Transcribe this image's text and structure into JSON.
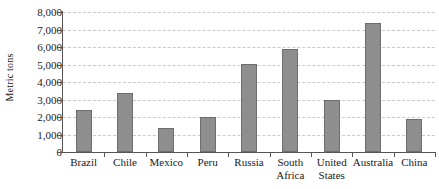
{
  "chart_data": {
    "type": "bar",
    "title": "",
    "subtitle": "",
    "xlabel": "",
    "ylabel": "Metric tons",
    "ylim": [
      0,
      8000
    ],
    "ytick_values": [
      0,
      1000,
      2000,
      3000,
      4000,
      5000,
      6000,
      7000,
      8000
    ],
    "ytick_labels": [
      "0",
      "1,000",
      "2,000",
      "3,000",
      "4,000",
      "5,000",
      "6,000",
      "7,000",
      "8,000"
    ],
    "grid": "horizontal-dashed",
    "legend": "none",
    "bar_color": "#8e8e8e",
    "bar_edge_color": "#6d6d6d",
    "axis_color": "#555555",
    "gridline_color": "#c9c9c9",
    "categories": [
      "Brazil",
      "Chile",
      "Mexico",
      "Peru",
      "Russia",
      "South\nAfrica",
      "United\nStates",
      "Australia",
      "China"
    ],
    "values": [
      2400,
      3400,
      1350,
      2000,
      5050,
      5900,
      2950,
      7400,
      1900
    ]
  }
}
